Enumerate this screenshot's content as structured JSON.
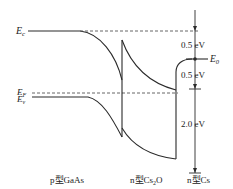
{
  "diagram": {
    "type": "energy-band-diagram",
    "levels": {
      "ec": {
        "symbol": "E",
        "sub": "c"
      },
      "ef": {
        "symbol": "E",
        "sub": "F"
      },
      "ev": {
        "symbol": "E",
        "sub": "v"
      },
      "e0": {
        "symbol": "E",
        "sub": "0"
      }
    },
    "annotations": {
      "gap_top": "0.5 eV",
      "gap_mid": "0.5 eV",
      "gap_bottom": "2.0 eV"
    },
    "regions": {
      "gaas": "p型GaAs",
      "cs2o_prefix": "n型Cs",
      "cs2o_sub": "2",
      "cs2o_suffix": "O",
      "cs": "n型Cs"
    },
    "colors": {
      "line": "#2a2a2a",
      "dashed": "#555555",
      "background": "#ffffff"
    }
  }
}
